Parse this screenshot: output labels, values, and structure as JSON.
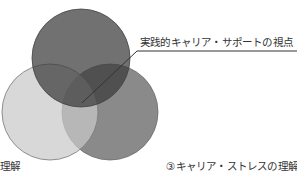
{
  "diagram": {
    "type": "venn",
    "circles": [
      {
        "id": "top",
        "cx": 81,
        "cy": 58,
        "r": 49,
        "fill": "#3a3a3a"
      },
      {
        "id": "left",
        "cx": 50,
        "cy": 112,
        "r": 48,
        "fill": "#c9c9c9"
      },
      {
        "id": "right",
        "cx": 110,
        "cy": 112,
        "r": 48,
        "fill": "#8a8a8a"
      }
    ],
    "labels": {
      "top_callout": "実践的キャリア・サポートの視点",
      "left": "の理解",
      "right": "③キャリア・ストレスの理解"
    },
    "leader_line": {
      "from": [
        82,
        103
      ],
      "elbow": [
        137,
        51
      ],
      "to": [
        297,
        51
      ],
      "color": "#333333"
    }
  }
}
